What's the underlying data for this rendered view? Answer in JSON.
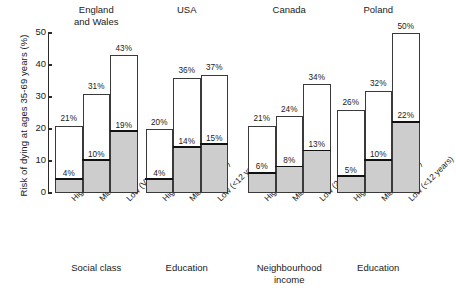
{
  "chart_data": {
    "type": "bar",
    "title": "",
    "ylabel": "Risk of dying at ages 35-69 years (%)",
    "xlabel": "",
    "ylim": [
      0,
      50
    ],
    "yticks": [
      0,
      10,
      20,
      30,
      40,
      50
    ],
    "grid": false,
    "legend": "none",
    "groups": [
      {
        "name": "England and Wales",
        "title_lines": [
          "England",
          "and Wales"
        ],
        "footer_lines": [
          "Social class"
        ],
        "categories": [
          "High (I/II)",
          "Mid (III/IV)",
          "Low (V)"
        ],
        "series": [
          {
            "name": "Total risk",
            "values": [
              21,
              31,
              43
            ],
            "value_labels": [
              "21%",
              "31%",
              "43%"
            ]
          },
          {
            "name": "Inner risk",
            "values": [
              4,
              10,
              19
            ],
            "value_labels": [
              "4%",
              "10%",
              "19%"
            ]
          }
        ]
      },
      {
        "name": "USA",
        "title_lines": [
          "USA"
        ],
        "footer_lines": [
          "Education"
        ],
        "categories": [
          "High (>12 years)",
          "Mid (12 years)",
          "Low (<12 years)"
        ],
        "series": [
          {
            "name": "Total risk",
            "values": [
              20,
              36,
              37
            ],
            "value_labels": [
              "20%",
              "36%",
              "37%"
            ]
          },
          {
            "name": "Inner risk",
            "values": [
              4,
              14,
              15
            ],
            "value_labels": [
              "4%",
              "14%",
              "15%"
            ]
          }
        ]
      },
      {
        "name": "Canada",
        "title_lines": [
          "Canada"
        ],
        "footer_lines": [
          "Neighbourhood",
          "income"
        ],
        "categories": [
          "High (20%)",
          "Mid (60%)",
          "Low (20%)"
        ],
        "series": [
          {
            "name": "Total risk",
            "values": [
              21,
              24,
              34
            ],
            "value_labels": [
              "21%",
              "24%",
              "34%"
            ]
          },
          {
            "name": "Inner risk",
            "values": [
              6,
              8,
              13
            ],
            "value_labels": [
              "6%",
              "8%",
              "13%"
            ]
          }
        ]
      },
      {
        "name": "Poland",
        "title_lines": [
          "Poland"
        ],
        "footer_lines": [
          "Education"
        ],
        "categories": [
          "High (>12 years)",
          "Mid (12 years)",
          "Low (<12 years)"
        ],
        "series": [
          {
            "name": "Total risk",
            "values": [
              26,
              32,
              50
            ],
            "value_labels": [
              "26%",
              "32%",
              "50%"
            ]
          },
          {
            "name": "Inner risk",
            "values": [
              5,
              10,
              22
            ],
            "value_labels": [
              "5%",
              "10%",
              "22%"
            ]
          }
        ]
      }
    ],
    "colors": {
      "bar_outline": "#3a3a3a",
      "bar_face": "#ffffff",
      "inner_fill": "#cdcdcd",
      "inner_line": "#111111",
      "axis": "#2a2a2a",
      "text": "#1a1a1a",
      "background": "#ffffff"
    }
  }
}
